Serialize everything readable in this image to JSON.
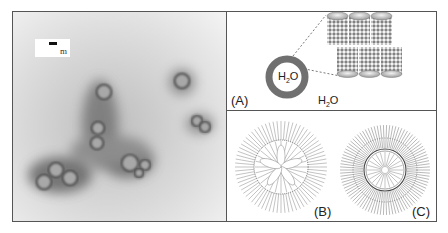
{
  "figure": {
    "tem_panel": {
      "scale_bar_label": "m",
      "particles": [
        {
          "x": 104,
          "y": 92,
          "r": 7
        },
        {
          "x": 98,
          "y": 128,
          "r": 6
        },
        {
          "x": 97,
          "y": 143,
          "r": 6
        },
        {
          "x": 56,
          "y": 170,
          "r": 7
        },
        {
          "x": 44,
          "y": 182,
          "r": 7
        },
        {
          "x": 70,
          "y": 178,
          "r": 7
        },
        {
          "x": 130,
          "y": 163,
          "r": 8
        },
        {
          "x": 145,
          "y": 165,
          "r": 5
        },
        {
          "x": 139,
          "y": 173,
          "r": 4
        },
        {
          "x": 182,
          "y": 81,
          "r": 7
        },
        {
          "x": 197,
          "y": 121,
          "r": 5
        },
        {
          "x": 205,
          "y": 127,
          "r": 5
        }
      ]
    },
    "panel_a": {
      "label": "(A)",
      "inner_water_label": "H",
      "inner_water_sub": "2",
      "inner_water_suffix": "O",
      "outer_water_label": "H",
      "outer_water_sub": "2",
      "outer_water_suffix": "O"
    },
    "panel_b": {
      "label": "(B)"
    },
    "panel_c": {
      "label": "(C)"
    },
    "colors": {
      "border": "#555555",
      "ring": "#707070",
      "tube_cap": "#bcbcbc",
      "tem_background": "#d8d8d8",
      "particle_halo": "#4a4a4a"
    }
  }
}
